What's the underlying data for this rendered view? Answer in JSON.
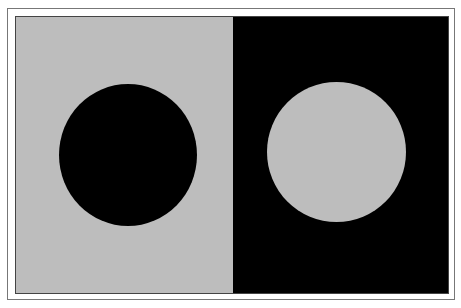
{
  "figure": {
    "colors": {
      "gray": "#bdbdbd",
      "black": "#000000",
      "frame": "#777777",
      "background": "#ffffff"
    },
    "panels": [
      {
        "side": "left",
        "background": "gray",
        "disc": "black"
      },
      {
        "side": "right",
        "background": "black",
        "disc": "gray"
      }
    ]
  }
}
